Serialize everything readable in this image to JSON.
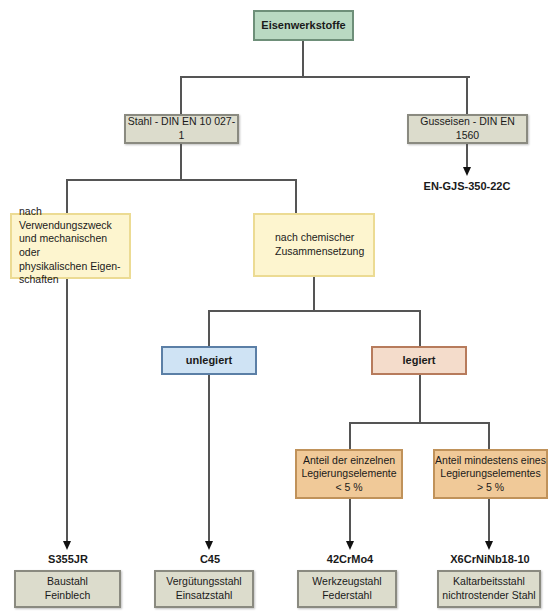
{
  "root": {
    "label": "Eisenwerkstoffe"
  },
  "level1": {
    "stahl": {
      "label": "Stahl - DIN EN 10 027-1"
    },
    "guss": {
      "label": "Gusseisen - DIN EN 1560",
      "example": "EN-GJS-350-22C"
    }
  },
  "level2": {
    "verwendung": {
      "lines": [
        "nach Verwendungszweck",
        "und mechanischen oder",
        "physikalischen Eigen-",
        "schaften"
      ]
    },
    "chemisch": {
      "lines": [
        "nach chemischer",
        "Zusammensetzung"
      ]
    }
  },
  "level3": {
    "unlegiert": {
      "label": "unlegiert"
    },
    "legiert": {
      "label": "legiert"
    }
  },
  "level4": {
    "niedrig": {
      "lines": [
        "Anteil der einzelnen",
        "Legierungselemente",
        "< 5 %"
      ]
    },
    "hoch": {
      "lines": [
        "Anteil mindestens eines",
        "Legierungselementes",
        "> 5 %"
      ]
    }
  },
  "examples": [
    {
      "code": "S355JR",
      "lines": [
        "Baustahl",
        "Feinblech"
      ]
    },
    {
      "code": "C45",
      "lines": [
        "Vergütungsstahl",
        "Einsatzstahl"
      ]
    },
    {
      "code": "42CrMo4",
      "lines": [
        "Werkzeugstahl",
        "Federstahl"
      ]
    },
    {
      "code": "X6CrNiNb18-10",
      "lines": [
        "Kaltarbeitsstahl",
        "nichtrostender Stahl"
      ]
    }
  ],
  "colors": {
    "root": "#b9d9c2",
    "level1": "#dcdccc",
    "level2": "#fdf5cf",
    "unlegiert": "#cfe3f4",
    "legiert": "#f4dccb",
    "level4": "#f0c998",
    "line": "#555555"
  }
}
